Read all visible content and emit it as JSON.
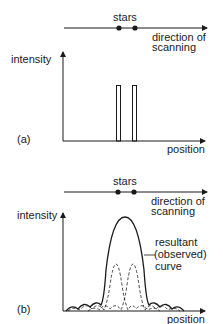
{
  "panel_a": {
    "label": "(a)",
    "stars_label": "stars",
    "direction_line1": "direction of",
    "direction_line2": "scanning",
    "y_axis_label": "intensity",
    "x_axis_label": "position"
  },
  "panel_b": {
    "label": "(b)",
    "stars_label": "stars",
    "direction_line1": "direction of",
    "direction_line2": "scanning",
    "y_axis_label": "intensity",
    "x_axis_label": "position",
    "curve_line1": "resultant",
    "curve_line2": "(observed)",
    "curve_line3": "curve"
  },
  "colors": {
    "ink": "#1a1a1a",
    "background": "#ffffff"
  }
}
